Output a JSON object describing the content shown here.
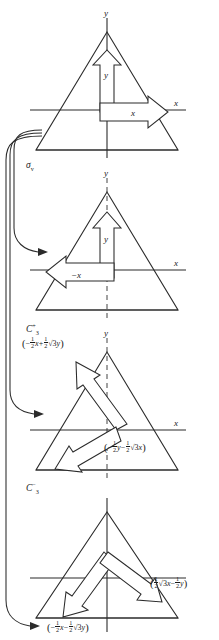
{
  "figure": {
    "background_color": "#ffffff",
    "ink_color": "#2b2b2b"
  },
  "panels": [
    {
      "id": "panel-reference",
      "operation_label": "",
      "axis_labels": {
        "x": "x",
        "y": "y"
      },
      "vector_labels": [
        {
          "name": "y-vector-label",
          "text": "y"
        },
        {
          "name": "x-vector-label",
          "text": "x"
        }
      ],
      "expressions": [],
      "y_axis_style": "solid"
    },
    {
      "id": "panel-sigma-v",
      "operation_label": "σ",
      "operation_sub": "v",
      "operation_sup": "",
      "axis_labels": {
        "x": "x",
        "y": "y"
      },
      "vector_labels": [
        {
          "name": "y-vector-label",
          "text": "y"
        },
        {
          "name": "negative-x-vector-label",
          "text": "−x"
        }
      ],
      "expressions": [],
      "y_axis_style": "dashed"
    },
    {
      "id": "panel-c3-plus",
      "operation_label": "C",
      "operation_sub": "3",
      "operation_sup": "+",
      "axis_labels": {
        "x": "x",
        "y": "y"
      },
      "vector_labels": [],
      "expressions": [
        {
          "name": "c3-plus-x-transform",
          "sign1": "−",
          "coef1_num": "1",
          "coef1_den": "2",
          "var1": "x",
          "sign2": "+",
          "coef2_num": "1",
          "coef2_den": "2",
          "radical": "√3",
          "var2": "y",
          "plain": "(−½x + ½√3y)"
        },
        {
          "name": "c3-plus-y-transform",
          "sign1": "−",
          "coef1_num": "1",
          "coef1_den": "2",
          "var1": "y",
          "sign2": "−",
          "coef2_num": "1",
          "coef2_den": "2",
          "radical": "√3",
          "var2": "x",
          "plain": "(−½y − ½√3x)"
        }
      ],
      "y_axis_style": "dashed"
    },
    {
      "id": "panel-c3-minus",
      "operation_label": "C",
      "operation_sub": "3",
      "operation_sup": "−",
      "axis_labels": {
        "x": "",
        "y": ""
      },
      "vector_labels": [],
      "expressions": [
        {
          "name": "c3-minus-x-transform",
          "sign1": "",
          "coef1_num": "1",
          "coef1_den": "2",
          "radical": "√3",
          "var1": "x",
          "sign2": "−",
          "coef2_num": "1",
          "coef2_den": "2",
          "var2": "y",
          "plain": "(½√3x − ½y)"
        },
        {
          "name": "c3-minus-y-transform",
          "sign1": "−",
          "coef1_num": "1",
          "coef1_den": "2",
          "var1": "x",
          "sign2": "−",
          "coef2_num": "1",
          "coef2_den": "2",
          "radical": "√3",
          "var2": "y",
          "plain": "(−½x − ½√3y)"
        }
      ],
      "y_axis_style": "solid"
    }
  ],
  "connectors": [
    {
      "name": "connector-to-sigma-v",
      "from": "panel-reference",
      "to": "panel-sigma-v"
    },
    {
      "name": "connector-to-c3-plus",
      "from": "panel-reference",
      "to": "panel-c3-plus"
    },
    {
      "name": "connector-to-c3-minus",
      "from": "panel-reference",
      "to": "panel-c3-minus"
    }
  ]
}
